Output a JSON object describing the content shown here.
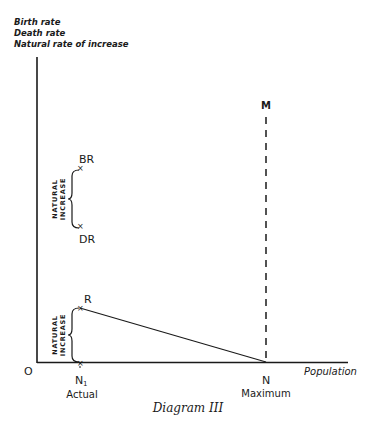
{
  "diagram": {
    "caption": "Diagram III",
    "y_axis_labels": [
      "Birth rate",
      "Death rate",
      "Natural rate of increase"
    ],
    "x_axis_label": "Population",
    "origin_label": "O",
    "points": {
      "M": "M",
      "BR": "BR",
      "DR": "DR",
      "R": "R",
      "N1": "N",
      "N1_sub": "1",
      "N": "N"
    },
    "x_tick_labels": {
      "actual": "Actual",
      "maximum": "Maximum"
    },
    "brace_labels": {
      "upper": [
        "NATURAL",
        "INCREASE"
      ],
      "lower": [
        "NATURAL",
        "INCREASE"
      ]
    },
    "colors": {
      "ink": "#1a1a1a",
      "background": "#ffffff"
    }
  }
}
